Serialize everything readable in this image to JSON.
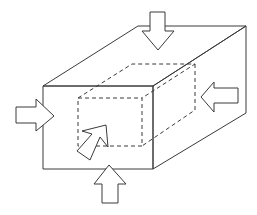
{
  "diagram": {
    "title": "",
    "colors": {
      "stroke": "#3a3a3a",
      "background": "#ffffff",
      "arrow_fill": "#ffffff"
    },
    "outer_block": {
      "front_face": "43,86 153,86 153,169 43,169",
      "top_face": "43,86 138,26 246,26 153,86",
      "right_face": "153,86 246,26 246,113 153,169"
    },
    "inner_block": {
      "front_face": "78,98 142,98 142,146 78,146",
      "back_top": "78,98 132,64 195,64 142,98",
      "back_right": "195,64 195,110 142,146"
    },
    "arrows": [
      {
        "id": "top",
        "direction": "down",
        "points": "150,12 165,12 165,31 174,31 158,50 142,31 150,31"
      },
      {
        "id": "left",
        "direction": "right",
        "points": "16,107 36,107 36,99 54,116 36,131 36,123 16,123"
      },
      {
        "id": "right",
        "direction": "left",
        "points": "238,88 214,88 214,82 201,97 214,112 214,103 238,103"
      },
      {
        "id": "bottom",
        "direction": "up",
        "points": "102,203 118,203 118,184 126,184 109,165 94,184 102,184"
      },
      {
        "id": "front",
        "direction": "into-page",
        "points": "82,131 106,125 108,147 100,137 90,160 77,151 92,134"
      }
    ]
  }
}
